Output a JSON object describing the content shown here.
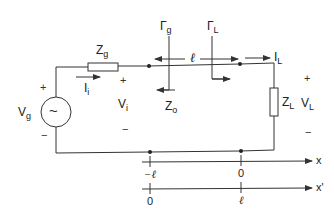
{
  "diagram": {
    "colors": {
      "line": "#333333",
      "background": "#ffffff"
    },
    "source": {
      "label": "V",
      "subscript": "g",
      "symbol": "~",
      "plus": "+",
      "minus": "−"
    },
    "generator_impedance": {
      "label": "Z",
      "subscript": "g"
    },
    "input_current": {
      "label": "I",
      "subscript": "i"
    },
    "input_voltage": {
      "label": "V",
      "subscript": "i",
      "plus": "+",
      "minus": "−"
    },
    "characteristic_impedance": {
      "label": "Z",
      "subscript": "o"
    },
    "reflection_gen": {
      "label": "Γ",
      "subscript": "g"
    },
    "reflection_load": {
      "label": "Γ",
      "subscript": "L"
    },
    "line_length": {
      "label": "ℓ"
    },
    "load_current": {
      "label": "I",
      "subscript": "L"
    },
    "load_impedance": {
      "label": "Z",
      "subscript": "L"
    },
    "load_voltage": {
      "label": "V",
      "subscript": "L",
      "plus": "+",
      "minus": "−"
    },
    "axis_x": {
      "label": "x",
      "ticks": [
        {
          "pos": "left",
          "label": "−ℓ"
        },
        {
          "pos": "right",
          "label": "0"
        }
      ]
    },
    "axis_xprime": {
      "label": "x'",
      "ticks": [
        {
          "pos": "left",
          "label": "0"
        },
        {
          "pos": "right",
          "label": "ℓ"
        }
      ]
    }
  }
}
